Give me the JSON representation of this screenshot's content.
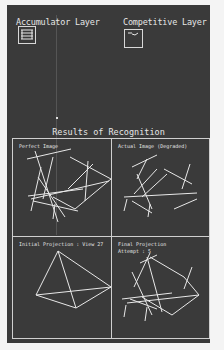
{
  "window": {
    "accumulator_title": "Accumulator Layer",
    "competitive_title": "Competitive Layer"
  },
  "results": {
    "title": "Results of Recognition",
    "panels": [
      {
        "label": "Perfect Image"
      },
      {
        "label": "Actual Image (Degraded)"
      },
      {
        "label": "Initial Projection : View 27"
      },
      {
        "label": "Final Projection",
        "sublabel": "Attempt : 5"
      }
    ]
  },
  "colors": {
    "background": "#3a3a3a",
    "foreground": "#e6e6e6",
    "page": "#f4f4f4"
  }
}
